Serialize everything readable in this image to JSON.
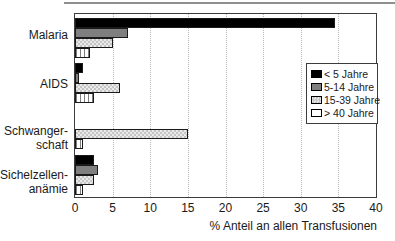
{
  "figure": {
    "top_rule_color": "#8f8f8f",
    "background": "#ffffff"
  },
  "chart_data": {
    "type": "bar",
    "orientation": "horizontal",
    "title": "",
    "xlabel": "% Anteil an allen Transfusionen",
    "xlim": [
      0,
      40
    ],
    "xticks": [
      0,
      5,
      10,
      15,
      20,
      25,
      30,
      35,
      40
    ],
    "grid": "dotted-vertical",
    "legend_position": "upper-right",
    "categories": [
      "Malaria",
      "AIDS",
      "Schwangerschaft",
      "Sichelzellenanämie"
    ],
    "category_label_lines": [
      [
        "Malaria"
      ],
      [
        "AIDS"
      ],
      [
        "Schwanger-",
        "schaft"
      ],
      [
        "Sichelzellen-",
        "anämie"
      ]
    ],
    "series": [
      {
        "name": "< 5 Jahre",
        "pattern": "solid",
        "color": "#000000",
        "values": [
          34.5,
          1,
          0,
          2.5
        ]
      },
      {
        "name": "5-14 Jahre",
        "pattern": "solid",
        "color": "#7f7f7f",
        "values": [
          7,
          0.5,
          0,
          3
        ]
      },
      {
        "name": "15-39 Jahre",
        "pattern": "checker",
        "color": "#cdcdcd",
        "values": [
          5,
          6,
          15,
          2.5
        ]
      },
      {
        "name": "> 40 Jahre",
        "pattern": "vertical-lines",
        "color": "#ffffff",
        "values": [
          2,
          2.5,
          1,
          1
        ]
      }
    ]
  }
}
